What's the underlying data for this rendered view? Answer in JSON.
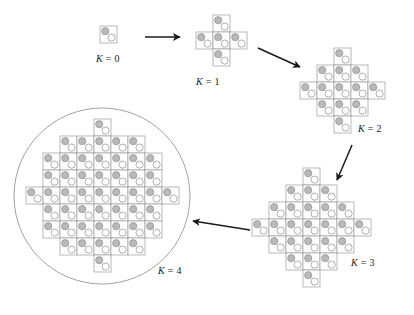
{
  "figure": {
    "type": "diagram",
    "background": "#ffffff",
    "colors": {
      "tile_stroke": "#9a9a9a",
      "tile_fill": "#ffffff",
      "dot_filled": "#b9b9b9",
      "dot_filled_stroke": "#8f8f8f",
      "dot_open_fill": "#ffffff",
      "dot_open_stroke": "#9a9a9a",
      "arrow": "#1a1a1a",
      "circle_stroke": "#8a8a8a",
      "label_text": "#1a1a1a"
    },
    "tile": {
      "size": 17,
      "dot_radius": 3.6,
      "dot_filled_offset": {
        "x": 5.2,
        "y": 5.2
      },
      "dot_open_offset": {
        "x": 11.6,
        "y": 11.6
      }
    }
  },
  "stages": [
    {
      "id": "k0",
      "label_k": "K",
      "label_eq": "=",
      "label_n": "0",
      "label_x": 96,
      "label_y": 53,
      "origin": {
        "x": 100,
        "y": 26
      },
      "rows": [
        1
      ],
      "row_offsets": [
        0
      ]
    },
    {
      "id": "k1",
      "label_k": "K",
      "label_eq": "=",
      "label_n": "1",
      "label_x": 196,
      "label_y": 76,
      "origin": {
        "x": 196,
        "y": 15
      },
      "rows": [
        1,
        3,
        1
      ],
      "row_offsets": [
        1,
        0,
        1
      ]
    },
    {
      "id": "k2",
      "label_k": "K",
      "label_eq": "=",
      "label_n": "2",
      "label_x": 358,
      "label_y": 123,
      "origin": {
        "x": 300,
        "y": 48
      },
      "rows": [
        1,
        3,
        5,
        3,
        1
      ],
      "row_offsets": [
        2,
        1,
        0,
        1,
        2
      ]
    },
    {
      "id": "k3",
      "label_k": "K",
      "label_eq": "=",
      "label_n": "3",
      "label_x": 351,
      "label_y": 257,
      "origin": {
        "x": 252,
        "y": 168
      },
      "rows": [
        1,
        3,
        5,
        7,
        5,
        3,
        1
      ],
      "row_offsets": [
        3,
        2,
        1,
        0,
        1,
        2,
        3
      ]
    },
    {
      "id": "k4",
      "label_k": "K",
      "label_eq": "=",
      "label_n": "4",
      "label_x": 158,
      "label_y": 265,
      "origin": {
        "x": 26,
        "y": 119
      },
      "rows": [
        1,
        5,
        7,
        7,
        9,
        7,
        7,
        5,
        1
      ],
      "row_offsets": [
        4,
        2,
        1,
        1,
        0,
        1,
        1,
        2,
        4
      ],
      "circle": {
        "cx": 102,
        "cy": 196,
        "r": 88
      }
    }
  ],
  "arrows": [
    {
      "id": "arrow-k0-k1",
      "x1": 145,
      "y1": 37,
      "x2": 180,
      "y2": 37
    },
    {
      "id": "arrow-k1-k2",
      "x1": 258,
      "y1": 48,
      "x2": 300,
      "y2": 67
    },
    {
      "id": "arrow-k2-k3",
      "x1": 352,
      "y1": 145,
      "x2": 337,
      "y2": 180
    },
    {
      "id": "arrow-k3-k4",
      "x1": 250,
      "y1": 230,
      "x2": 193,
      "y2": 221
    }
  ]
}
